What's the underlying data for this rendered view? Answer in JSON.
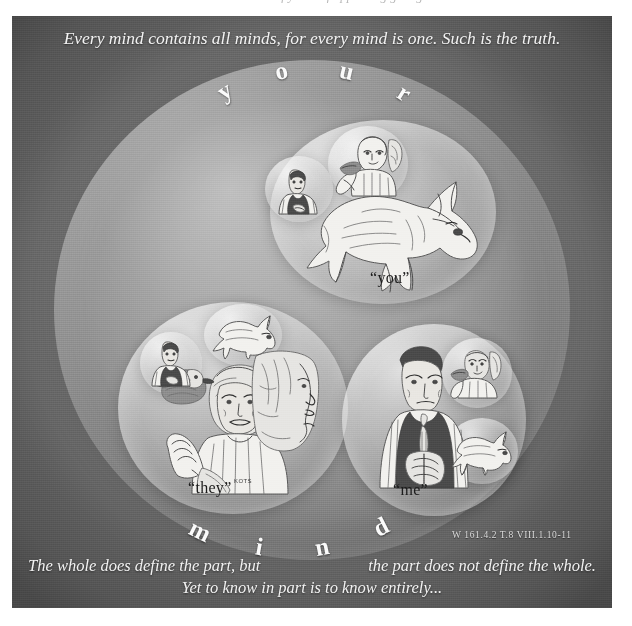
{
  "page": {
    "top_cutoff_text": "and and are of yours of appearing giving",
    "banner_quote": "Every mind contains all minds, for every mind is one. Such is the truth.",
    "arc_top_word": "your",
    "arc_bottom_word": "mind",
    "arc_top_letters": [
      "y",
      "o",
      "u",
      "r"
    ],
    "arc_bottom_letters": [
      "m",
      "i",
      "n",
      "d"
    ],
    "reference": "W 161.4.2   T.8 VIII.1.10-11",
    "footer_left": "The whole does define the part, but",
    "footer_right": "the part does not define the whole.",
    "footer_center": "Yet to know in part is to know entirely..."
  },
  "spheres": {
    "mind": {
      "name": "your mind",
      "label": ""
    },
    "you": {
      "name": "you sphere",
      "label": "“you”"
    },
    "they": {
      "name": "they sphere",
      "label": "“they”"
    },
    "me": {
      "name": "me sphere",
      "label": "“me”"
    }
  },
  "artist_signature": "KOTS",
  "colors": {
    "panel_light": "#9a9a9a",
    "panel_dark": "#686868",
    "banner_text": "#f3f3f3",
    "caption_text": "#1b1b1b",
    "ink": "#4b4b4b",
    "paper": "#f2f1ee"
  },
  "figures": {
    "you_fox": "fox-drawing",
    "you_woman": "woman-with-bird-drawing",
    "you_man": "man-in-vest-drawing",
    "they_woman": "elder-woman-drawing",
    "they_bird": "duck-drawing",
    "they_stone_profile": "stone-profile-drawing",
    "they_fox": "fox-drawing",
    "they_man": "man-in-vest-drawing",
    "me_man": "man-in-vest-drawing",
    "me_woman": "woman-with-bird-drawing",
    "me_fox": "fox-drawing"
  }
}
